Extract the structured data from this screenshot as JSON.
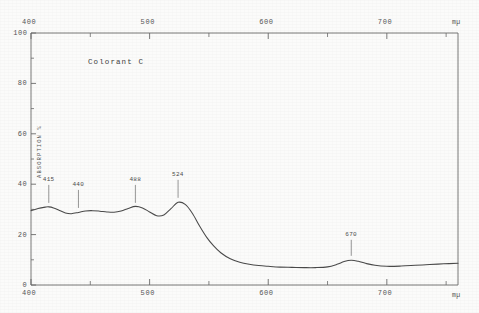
{
  "chart_data": {
    "type": "line",
    "title": "Colorant C",
    "xlabel": "",
    "ylabel": "ABSORPTION %",
    "x_unit": "mµ",
    "xlim": [
      400,
      760
    ],
    "ylim": [
      0,
      100
    ],
    "grid": false,
    "legend": "none",
    "x_axis_top": {
      "ticks_major": [
        400,
        500,
        600,
        700
      ],
      "ticks_minor": [
        450,
        550,
        650,
        750
      ],
      "tick_labels": [
        "400",
        "500",
        "600",
        "700"
      ],
      "unit": "mµ"
    },
    "x_axis_bottom": {
      "ticks_major": [
        400,
        500,
        600,
        700
      ],
      "ticks_minor": [
        450,
        550,
        650,
        750
      ],
      "tick_labels": [
        "400",
        "500",
        "600",
        "700"
      ],
      "unit": "mµ"
    },
    "y_axis": {
      "ticks_major": [
        0,
        20,
        40,
        60,
        80,
        100
      ],
      "tick_labels": [
        "0",
        "20",
        "40",
        "60",
        "80",
        "100"
      ],
      "ticks_minor": [
        10,
        30,
        50,
        70,
        90
      ]
    },
    "annotations": [
      {
        "label": "415",
        "x": 415,
        "y": 31
      },
      {
        "label": "440",
        "x": 440,
        "y": 29
      },
      {
        "label": "488",
        "x": 488,
        "y": 31
      },
      {
        "label": "524",
        "x": 524,
        "y": 33
      }
    ],
    "annotations_lower": [
      {
        "label": "670",
        "x": 670,
        "y": 10
      }
    ],
    "series": [
      {
        "name": "Colorant C absorption",
        "color": "#4a4a4a",
        "x": [
          400,
          406,
          412,
          415,
          419,
          424,
          429,
          434,
          440,
          446,
          452,
          458,
          464,
          470,
          476,
          482,
          488,
          494,
          500,
          506,
          512,
          518,
          524,
          530,
          536,
          542,
          548,
          554,
          560,
          568,
          576,
          584,
          592,
          600,
          610,
          620,
          630,
          640,
          650,
          658,
          664,
          670,
          676,
          682,
          690,
          700,
          712,
          724,
          736,
          748,
          760
        ],
        "y": [
          29.5,
          30.4,
          30.9,
          31.0,
          30.6,
          29.6,
          28.6,
          28.3,
          28.8,
          29.4,
          29.5,
          29.3,
          29.0,
          28.9,
          29.4,
          30.4,
          31.2,
          30.6,
          29.0,
          27.5,
          27.8,
          30.3,
          32.8,
          32.0,
          28.5,
          23.5,
          19.0,
          15.5,
          12.8,
          10.4,
          9.0,
          8.2,
          7.7,
          7.4,
          7.1,
          7.0,
          6.9,
          6.9,
          7.2,
          8.2,
          9.3,
          9.8,
          9.4,
          8.6,
          7.8,
          7.4,
          7.5,
          7.8,
          8.1,
          8.4,
          8.6
        ]
      }
    ]
  },
  "axes_text": {
    "top_unit": "mµ",
    "bottom_unit": "mµ",
    "y_title": "ABSORPTION %"
  }
}
